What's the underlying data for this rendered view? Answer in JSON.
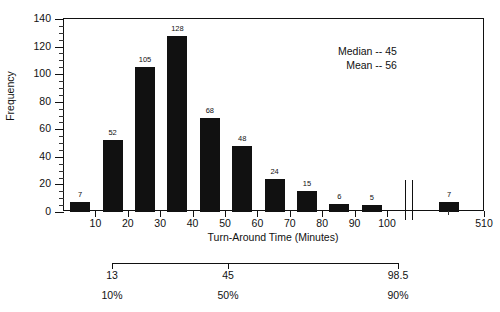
{
  "chart_data": {
    "type": "bar",
    "title": "",
    "xlabel": "Turn-Around Time (Minutes)",
    "ylabel": "Frequency",
    "xlim": [
      0,
      100
    ],
    "ylim": [
      0,
      140
    ],
    "grid": false,
    "legend": "none",
    "axis_break": {
      "present": true,
      "after_value": 100,
      "resume_label": "510"
    },
    "y_ticks": [
      0,
      20,
      40,
      60,
      80,
      100,
      120,
      140
    ],
    "y_minor_step": 5,
    "x_ticks": [
      10,
      20,
      30,
      40,
      50,
      60,
      70,
      80,
      90,
      100,
      510
    ],
    "categories": [
      "0-10",
      "10-20",
      "20-30",
      "30-40",
      "40-50",
      "50-60",
      "60-70",
      "70-80",
      "80-90",
      "90-100",
      "~510"
    ],
    "values": [
      7,
      52,
      105,
      128,
      68,
      48,
      24,
      15,
      6,
      5,
      7
    ],
    "bar_labels": [
      "7",
      "52",
      "105",
      "128",
      "68",
      "48",
      "24",
      "15",
      "6",
      "5",
      "7"
    ],
    "annotations": {
      "median_label": "Median -- 45",
      "mean_label": "Mean -- 56",
      "median_value": 45,
      "mean_value": 56
    },
    "percentile_scale": {
      "values": [
        "13",
        "45",
        "98.5"
      ],
      "percents": [
        "10%",
        "50%",
        "90%"
      ]
    },
    "colors": {
      "bar": "#111111",
      "axis": "#111111",
      "background": "#ffffff"
    }
  }
}
